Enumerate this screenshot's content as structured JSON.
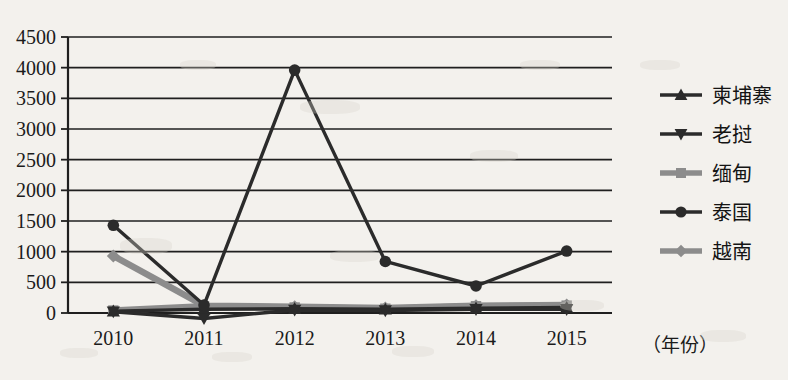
{
  "chart_data": {
    "type": "line",
    "title": "",
    "xlabel": "（年份）",
    "ylabel": "",
    "categories": [
      "2010",
      "2011",
      "2012",
      "2013",
      "2014",
      "2015"
    ],
    "x": [
      2010,
      2011,
      2012,
      2013,
      2014,
      2015
    ],
    "ylim": [
      0,
      4500
    ],
    "yticks": [
      0,
      500,
      1000,
      1500,
      2000,
      2500,
      3000,
      3500,
      4000,
      4500
    ],
    "ytick_labels": [
      "0",
      "500",
      "1000",
      "1500",
      "2000",
      "2500",
      "3000",
      "3500",
      "4000",
      "4500"
    ],
    "grid": true,
    "legend_position": "right",
    "series": [
      {
        "name": "柬埔寨",
        "marker": "triangle",
        "color": "#2b2b2b",
        "values": [
          30,
          60,
          70,
          60,
          80,
          90
        ]
      },
      {
        "name": "老挝",
        "marker": "triangle-down",
        "color": "#2b2b2b",
        "values": [
          20,
          -90,
          50,
          40,
          60,
          60
        ]
      },
      {
        "name": "缅甸",
        "marker": "square",
        "color": "#8c8c8c",
        "values": [
          40,
          110,
          90,
          70,
          110,
          120
        ]
      },
      {
        "name": "泰国",
        "marker": "circle",
        "color": "#2b2b2b",
        "values": [
          1430,
          130,
          3960,
          840,
          440,
          1010
        ]
      },
      {
        "name": "越南",
        "marker": "diamond",
        "color": "#8c8c8c",
        "values": [
          930,
          120,
          100,
          80,
          120,
          130
        ]
      }
    ]
  },
  "axes": {
    "x_axis_name": "（年份）"
  },
  "legend": {
    "items": [
      {
        "label": "柬埔寨",
        "marker": "triangle-up-icon",
        "color": "#2b2b2b"
      },
      {
        "label": "老挝",
        "marker": "triangle-down-icon",
        "color": "#2b2b2b"
      },
      {
        "label": "缅甸",
        "marker": "square-icon",
        "color": "#8c8c8c"
      },
      {
        "label": "泰国",
        "marker": "circle-icon",
        "color": "#2b2b2b"
      },
      {
        "label": "越南",
        "marker": "diamond-icon",
        "color": "#8c8c8c"
      }
    ]
  },
  "colors": {
    "background": "#f3f1ed",
    "axis": "#1f1f1f",
    "dark_series": "#2b2b2b",
    "gray_series": "#8c8c8c"
  }
}
